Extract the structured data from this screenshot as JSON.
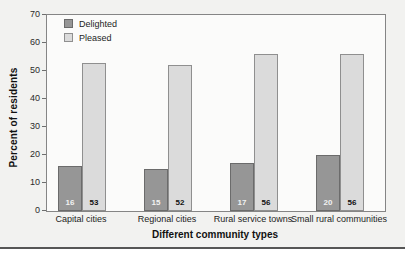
{
  "figure": {
    "background_color": "#f2f2f0",
    "plot_background_color": "#fbfbfa",
    "bottom_rule_color": "#565656"
  },
  "chart_data": {
    "type": "bar",
    "title": "",
    "xlabel": "Different community types",
    "ylabel": "Percent of residents",
    "categories": [
      "Capital cities",
      "Regional cities",
      "Rural service towns",
      "Small rural communities"
    ],
    "series": [
      {
        "name": "Delighted",
        "values": [
          16,
          15,
          17,
          20
        ],
        "color": "#969696",
        "border_color": "#6b6b6b",
        "label_color": "#f2f2f2"
      },
      {
        "name": "Pleased",
        "values": [
          53,
          52,
          56,
          56
        ],
        "color": "#dbdbdb",
        "border_color": "#8f8f8f",
        "label_color": "#111111"
      }
    ],
    "ylim": [
      0,
      70
    ],
    "yticks": [
      0,
      10,
      20,
      30,
      40,
      50,
      60,
      70
    ],
    "grid": false,
    "legend_position": "top-left",
    "bar_value_labels": true
  }
}
